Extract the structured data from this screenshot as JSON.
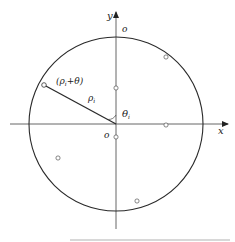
{
  "diagram": {
    "type": "polar-coordinate-circle",
    "colors": {
      "stroke": "#2a2a2a",
      "axis": "#555555",
      "point_fill": "#ffffff",
      "background": "#ffffff"
    },
    "axes": {
      "x_label": "x",
      "y_label": "y",
      "origin_label": "o"
    },
    "circle": {
      "top_label": "o"
    },
    "labels": {
      "point_label": "(ρ",
      "point_label_sub": "i",
      "point_label_tail": "+θ)",
      "radius_label": "ρ",
      "radius_label_sub": "i",
      "angle_label": "θ",
      "angle_label_sub": "i"
    },
    "points": [
      {
        "id": "p1",
        "x": 44,
        "y": 85
      },
      {
        "id": "p2",
        "x": 166,
        "y": 57
      },
      {
        "id": "p3",
        "x": 116,
        "y": 88
      },
      {
        "id": "p4",
        "x": 166,
        "y": 125
      },
      {
        "id": "p5",
        "x": 116,
        "y": 137
      },
      {
        "id": "p6",
        "x": 58,
        "y": 158
      },
      {
        "id": "p7",
        "x": 137,
        "y": 201
      }
    ]
  }
}
